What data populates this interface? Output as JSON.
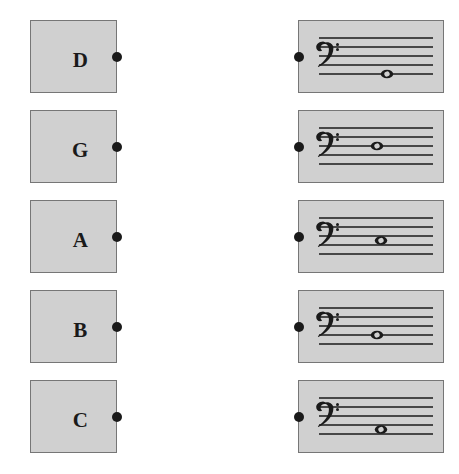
{
  "page": {
    "background_color": "#ffffff",
    "card_fill_color": "#d0d0d0",
    "card_border_color": "#767676",
    "dot_color": "#1a1a1a",
    "ink_color": "#1a1a1a"
  },
  "left_column": {
    "name": "note-letter-cards",
    "items": [
      {
        "label": "D"
      },
      {
        "label": "G"
      },
      {
        "label": "A"
      },
      {
        "label": "B"
      },
      {
        "label": "C"
      }
    ]
  },
  "right_column": {
    "name": "bass-clef-staff-cards",
    "clef": "bass-clef",
    "note_type": "whole-note",
    "staff_line_count": 5,
    "items": [
      {
        "note_letter": "G",
        "position_description": "on bottom line (line 5)",
        "staff_step": 8,
        "note_x": 88
      },
      {
        "note_letter": "D",
        "position_description": "on middle line (line 3)",
        "staff_step": 4,
        "note_x": 78
      },
      {
        "note_letter": "C",
        "position_description": "in space between line 3 and line 4",
        "staff_step": 5,
        "note_x": 82
      },
      {
        "note_letter": "B",
        "position_description": "on line 4",
        "staff_step": 6,
        "note_x": 78
      },
      {
        "note_letter": "A",
        "position_description": "in space between line 4 and line 5",
        "staff_step": 7,
        "note_x": 82
      }
    ]
  }
}
